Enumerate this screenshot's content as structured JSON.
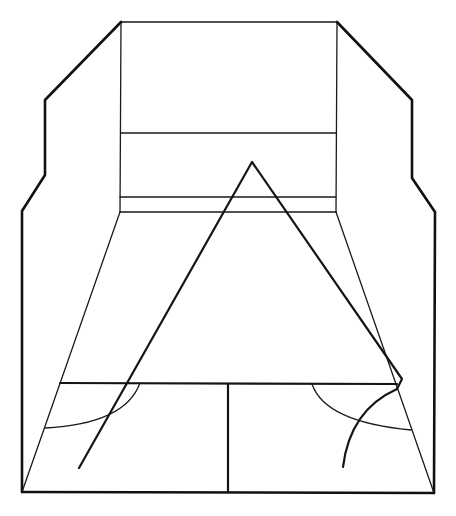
{
  "diagram": {
    "background": "#ffffff",
    "stroke_color": "#111111",
    "court": {
      "front_wall": {
        "top_left": [
          121,
          22
        ],
        "top_right": [
          337,
          22
        ],
        "bottom_left": [
          120,
          212
        ],
        "bottom_right": [
          336,
          212
        ]
      },
      "front_wall_lines_y": [
        133,
        197
      ],
      "left_wall_outline": [
        [
          121,
          22
        ],
        [
          45,
          100
        ],
        [
          45,
          175
        ],
        [
          22,
          211
        ],
        [
          22,
          492
        ]
      ],
      "right_wall_outline": [
        [
          337,
          22
        ],
        [
          412,
          100
        ],
        [
          412,
          178
        ],
        [
          435,
          212
        ],
        [
          434,
          493
        ]
      ],
      "floor_back_line": {
        "from": [
          22,
          492
        ],
        "to": [
          434,
          493
        ]
      },
      "short_line": {
        "from": [
          60,
          383
        ],
        "to": [
          397,
          384
        ]
      },
      "half_court_line": {
        "from": [
          228,
          383
        ],
        "to": [
          228,
          492
        ]
      },
      "left_service_box_arc": {
        "from": [
          45,
          428
        ],
        "to": [
          140,
          383
        ]
      },
      "right_service_box_arc": {
        "from": [
          312,
          384
        ],
        "to": [
          411,
          430
        ]
      }
    },
    "trajectory": {
      "points": [
        [
          79,
          468
        ],
        [
          252,
          162
        ],
        [
          402,
          379
        ],
        [
          397,
          389
        ],
        [
          343,
          467
        ]
      ],
      "apex": [
        252,
        162
      ]
    }
  }
}
